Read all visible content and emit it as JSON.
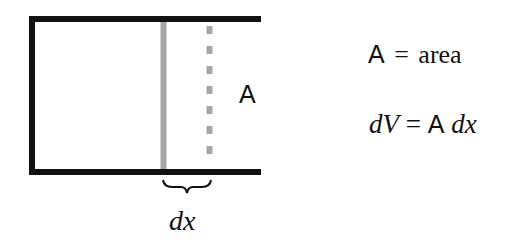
{
  "diagram": {
    "cylinder_label": "A",
    "slice_width_label_d": "d",
    "slice_width_label_x": "x",
    "colors": {
      "outline": "#111111",
      "slice_solid": "#a6a6a6",
      "slice_dashed": "#a6a6a6",
      "text": "#111111"
    }
  },
  "equations": {
    "area_def": {
      "symbol": "A",
      "equals": "=",
      "word": "area"
    },
    "volume_elem": {
      "lhs_d": "d",
      "lhs_V": "V",
      "equals": "=",
      "symbol": "A",
      "rhs_d": "d",
      "rhs_x": "x"
    }
  }
}
